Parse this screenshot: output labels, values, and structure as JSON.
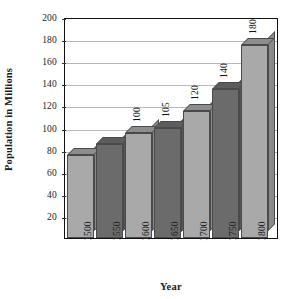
{
  "chart_data": {
    "type": "bar",
    "title": "",
    "xlabel": "Year",
    "ylabel": "Population in Millions",
    "categories": [
      "1500",
      "1550",
      "1600",
      "1650",
      "1700",
      "1750",
      "1800"
    ],
    "values": [
      75,
      85,
      95,
      100,
      115,
      135,
      175
    ],
    "data_labels": [
      "",
      "",
      "100",
      "105",
      "120",
      "140",
      "180"
    ],
    "ylim": [
      0,
      200
    ],
    "ytick_labels": [
      "200",
      "180",
      "160",
      "140",
      "120",
      "100",
      "80",
      "60",
      "40",
      "20"
    ],
    "ytick_values": [
      200,
      180,
      160,
      140,
      120,
      100,
      80,
      60,
      40,
      20
    ],
    "grid": true,
    "legend": "none",
    "bar_colors": [
      "#a9a9a9",
      "#6b6b6b",
      "#a9a9a9",
      "#6b6b6b",
      "#a9a9a9",
      "#6b6b6b",
      "#a9a9a9"
    ],
    "style": "3d-shadow-bars",
    "colors": {
      "light_bar": "#a9a9a9",
      "dark_bar": "#6b6b6b",
      "gridline": "#b9b9b9",
      "axis": "#111111",
      "background": "#ffffff",
      "text": "#1a1a1a"
    }
  }
}
